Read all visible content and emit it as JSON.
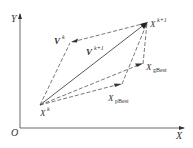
{
  "diagram": {
    "type": "pso-velocity-update",
    "axes": {
      "x_label": "X",
      "y_label": "Y",
      "origin_label": "O"
    },
    "points": {
      "xk": {
        "base": "X",
        "sup": "k"
      },
      "xk1": {
        "base": "X",
        "sup": "k+1"
      },
      "pbest": {
        "base": "X",
        "sub": "pBest"
      },
      "gbest": {
        "base": "X",
        "sub": "gBest"
      }
    },
    "vectors": {
      "vk": {
        "base": "V",
        "sup": "k"
      },
      "vk1": {
        "base": "V",
        "sup": "k+1"
      }
    },
    "colors": {
      "line": "#444444",
      "text": "#333333"
    }
  }
}
